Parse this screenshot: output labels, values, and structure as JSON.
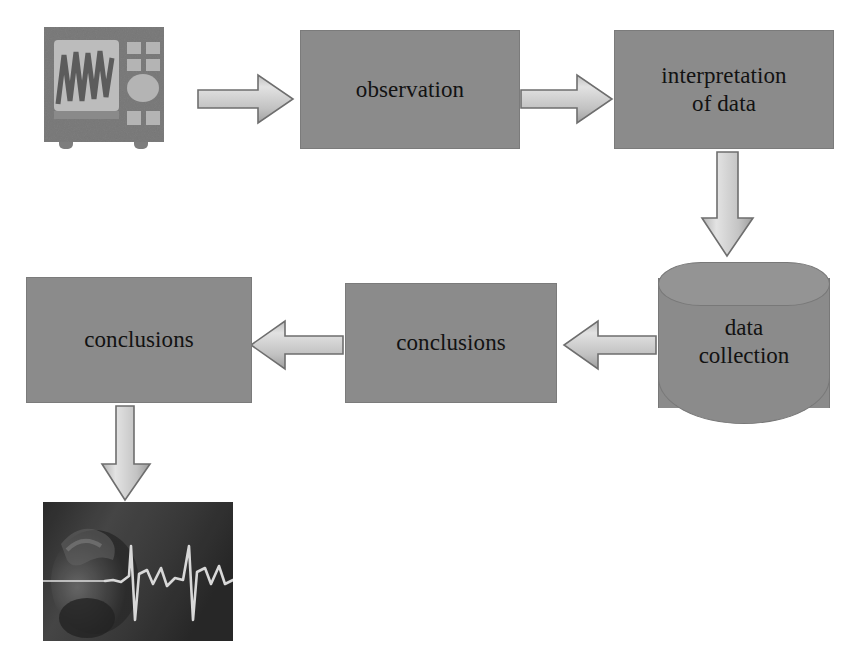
{
  "diagram": {
    "background_color": "#ffffff",
    "node_fill_color": "#8b8b8b",
    "node_border_color": "#787878",
    "text_color": "#121212",
    "arrow_fill_light": "#d8d8d8",
    "arrow_fill_dark": "#9a9a9a",
    "arrow_border_color": "#6e6e6e"
  },
  "nodes": {
    "oscilloscope": {
      "label": "",
      "icon": "oscilloscope-icon",
      "body_color": "#7d7d7d",
      "screen_color": "#b8b8b8",
      "trace_color": "#5a5a5a",
      "button_color": "#b2b2b2"
    },
    "observation": {
      "label": "observation"
    },
    "interpretation": {
      "label": "interpretation\nof data"
    },
    "data_collection": {
      "label": "data\ncollection",
      "shape": "cylinder"
    },
    "conclusions_middle": {
      "label": "conclusions"
    },
    "conclusions_left": {
      "label": "conclusions"
    },
    "ecg_photo": {
      "label": "",
      "icon": "ecg-photo",
      "background_color": "#3a3a3a",
      "trace_color": "#e8e8e8"
    }
  },
  "arrows": [
    {
      "name": "oscilloscope-to-observation",
      "direction": "right"
    },
    {
      "name": "observation-to-interpretation",
      "direction": "right"
    },
    {
      "name": "interpretation-to-data-collection",
      "direction": "down"
    },
    {
      "name": "data-collection-to-conclusions",
      "direction": "left"
    },
    {
      "name": "conclusions-to-conclusions",
      "direction": "left"
    },
    {
      "name": "conclusions-to-ecg-photo",
      "direction": "down"
    }
  ]
}
